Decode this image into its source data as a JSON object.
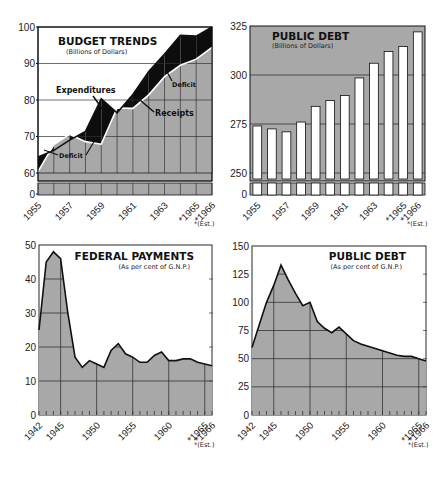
{
  "colors": {
    "fill_gray": "#a8a8a8",
    "grid": "#333333",
    "line": "#111111",
    "deficit": "#0d0d0d",
    "bar": "#ffffff",
    "background": "#ffffff"
  },
  "footnote": "*(Est.)",
  "chart_data": [
    {
      "id": "budget_trends",
      "type": "area",
      "title": "BUDGET TRENDS",
      "subtitle": "(Billions of Dollars)",
      "xlabel": "",
      "ylabel": "",
      "x": [
        1955,
        1956,
        1957,
        1958,
        1959,
        1960,
        1961,
        1962,
        1963,
        1964,
        1965,
        1966
      ],
      "x_tick_labels": [
        "1955",
        "1957",
        "1959",
        "1961",
        "1963",
        "*1965",
        "*1966"
      ],
      "y_tick_labels": [
        "0",
        "60",
        "70",
        "80",
        "90",
        "100"
      ],
      "ylim": [
        60,
        100
      ],
      "axis_break": true,
      "series": [
        {
          "name": "Expenditures",
          "values": [
            64.4,
            66.2,
            69.0,
            71.4,
            80.3,
            76.5,
            81.5,
            87.8,
            92.6,
            97.7,
            97.5,
            100.0
          ]
        },
        {
          "name": "Receipts",
          "values": [
            60.4,
            67.8,
            70.6,
            68.6,
            67.9,
            77.8,
            77.7,
            81.4,
            86.4,
            89.5,
            91.2,
            94.4
          ]
        }
      ],
      "annotations": [
        "Expenditures",
        "Receipts",
        "Deficit",
        "Deficit"
      ],
      "grid": true,
      "footnote": "*(Est.)"
    },
    {
      "id": "public_debt_billions",
      "type": "bar",
      "title": "PUBLIC DEBT",
      "subtitle": "(Billions of Dollars)",
      "categories": [
        "1955",
        "1956",
        "1957",
        "1958",
        "1959",
        "1960",
        "1961",
        "1962",
        "1963",
        "1964",
        "1965",
        "1966"
      ],
      "x_tick_labels": [
        "1955",
        "1957",
        "1959",
        "1961",
        "1963",
        "*1965",
        "*1966"
      ],
      "y_tick_labels": [
        "0",
        "250",
        "275",
        "300",
        "325"
      ],
      "values": [
        274,
        272.5,
        271,
        276,
        284,
        287,
        289.5,
        298.5,
        306,
        312,
        314.5,
        322
      ],
      "ylim": [
        250,
        325
      ],
      "axis_break": true,
      "grid": true,
      "footnote": "*(Est.)"
    },
    {
      "id": "federal_payments_gnp",
      "type": "area",
      "title": "FEDERAL PAYMENTS",
      "subtitle": "(As per cent of G.N.P.)",
      "x": [
        1942,
        1943,
        1944,
        1945,
        1946,
        1947,
        1948,
        1949,
        1950,
        1951,
        1952,
        1953,
        1954,
        1955,
        1956,
        1957,
        1958,
        1959,
        1960,
        1961,
        1962,
        1963,
        1964,
        1965,
        1966
      ],
      "values": [
        25,
        45,
        48,
        46,
        30,
        17,
        14,
        16,
        15,
        14,
        19,
        21,
        18,
        17,
        15.5,
        15.5,
        17.5,
        18.5,
        16,
        16,
        16.5,
        16.5,
        15.5,
        15,
        14.5
      ],
      "x_tick_labels": [
        "1942",
        "1945",
        "1950",
        "1955",
        "1960",
        "*1965",
        "*1966"
      ],
      "y_tick_labels": [
        "0",
        "10",
        "20",
        "30",
        "40",
        "50"
      ],
      "ylim": [
        0,
        50
      ],
      "grid": true,
      "footnote": "*(Est.)"
    },
    {
      "id": "public_debt_gnp",
      "type": "area",
      "title": "PUBLIC DEBT",
      "subtitle": "(As per cent of G.N.P.)",
      "x": [
        1942,
        1943,
        1944,
        1945,
        1946,
        1947,
        1948,
        1949,
        1950,
        1951,
        1952,
        1953,
        1954,
        1955,
        1956,
        1957,
        1958,
        1959,
        1960,
        1961,
        1962,
        1963,
        1964,
        1965,
        1966
      ],
      "values": [
        60,
        80,
        100,
        115,
        133,
        120,
        108,
        97,
        100,
        83,
        77,
        73,
        78,
        72,
        66,
        63,
        61,
        59,
        57,
        55,
        53,
        52,
        52,
        50,
        48
      ],
      "x_tick_labels": [
        "1942",
        "1945",
        "1950",
        "1955",
        "1960",
        "*1965",
        "*1966"
      ],
      "y_tick_labels": [
        "0",
        "25",
        "50",
        "75",
        "100",
        "125",
        "150"
      ],
      "ylim": [
        0,
        150
      ],
      "grid": true,
      "footnote": "*(Est.)"
    }
  ]
}
